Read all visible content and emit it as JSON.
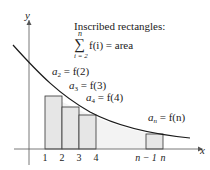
{
  "diagram": {
    "axes": {
      "x_label": "x",
      "y_label": "y"
    },
    "title": "Inscribed rectangles:",
    "sum": {
      "upper": "n",
      "lower": "i = 2",
      "sigma": "∑",
      "expr": "f(i) = area"
    },
    "labels": {
      "a2": {
        "var": "a",
        "sub": "2",
        "rhs": " = f(2)"
      },
      "a3": {
        "var": "a",
        "sub": "3",
        "rhs": " = f(3)"
      },
      "a4": {
        "var": "a",
        "sub": "4",
        "rhs": " = f(4)"
      },
      "an": {
        "var": "a",
        "sub": "n",
        "rhs": " = f(n)"
      }
    },
    "ticks": [
      "1",
      "2",
      "3",
      "4",
      "n − 1",
      "n"
    ],
    "colors": {
      "rect_fill": "#e8e8e8",
      "curve": "#1a1a1a",
      "axis": "#555555"
    }
  }
}
